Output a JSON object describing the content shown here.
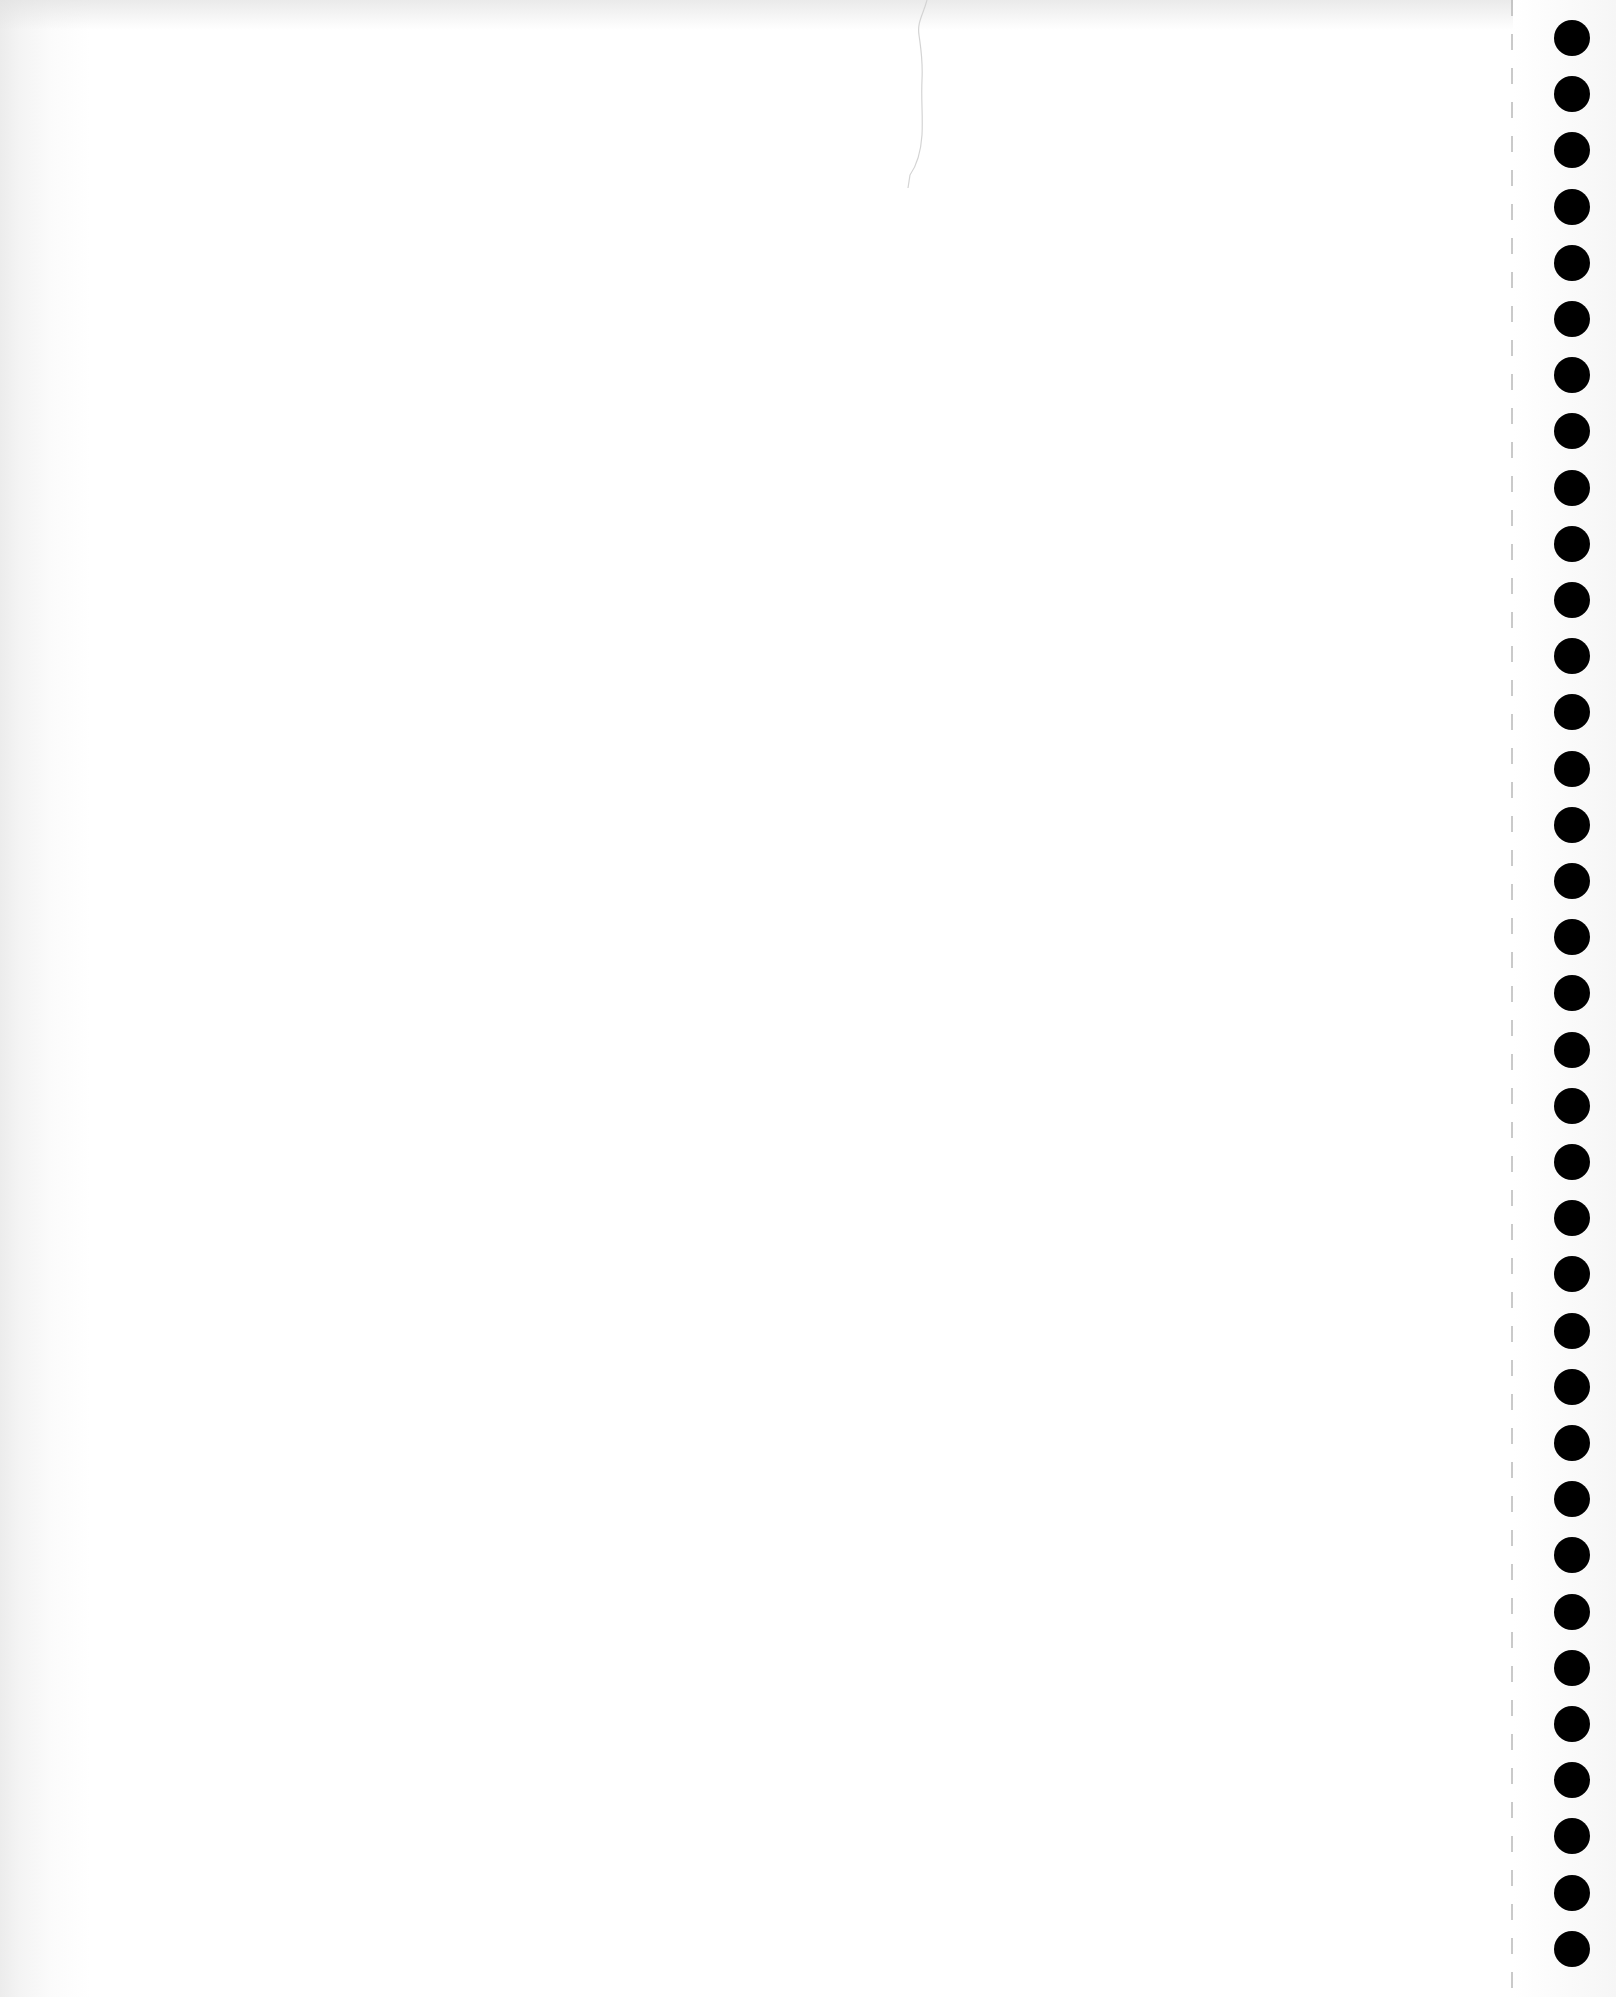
{
  "document": {
    "type": "blank continuous-feed paper scan",
    "text_content": "",
    "background_color": "#ffffff",
    "hole_color": "#000000",
    "perforation_color": "#b8b8b8"
  },
  "tractor_feed": {
    "hole_count": 35,
    "hole_diameter_px": 36,
    "hole_center_x_px": 1572,
    "first_hole_center_y_px": 38,
    "hole_spacing_px": 56.2,
    "perforation_x_px": 1511
  }
}
